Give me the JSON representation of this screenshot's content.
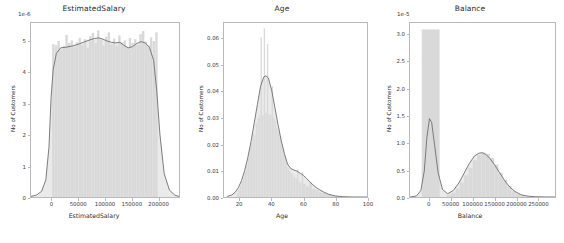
{
  "figure": {
    "background_color": "#ffffff",
    "hist_fill_color": "#d9d9d9",
    "kde_line_color": "#6e6e6e",
    "axis_color": "#b9b9b9",
    "text_color": "#2b2b2b"
  },
  "chart_data": [
    {
      "type": "area",
      "title": "EstimatedSalary",
      "xlabel": "EstimatedSalary",
      "ylabel": "No of Customers",
      "y_exponent_label": "1e-6",
      "grid": false,
      "legend": "none",
      "xlim": [
        -40000,
        240000
      ],
      "ylim": [
        0,
        5.6
      ],
      "xticks": [
        0,
        50000,
        100000,
        150000,
        200000
      ],
      "xticklabels": [
        "0",
        "50000",
        "100000",
        "150000",
        "200000"
      ],
      "yticks": [
        0,
        1,
        2,
        3,
        4,
        5
      ],
      "yticklabels": [
        "0",
        "1",
        "2",
        "3",
        "4",
        "5"
      ],
      "series": [
        {
          "name": "histogram",
          "bin_centers": [
            2500,
            7500,
            12500,
            17500,
            22500,
            27500,
            32500,
            37500,
            42500,
            47500,
            52500,
            57500,
            62500,
            67500,
            72500,
            77500,
            82500,
            87500,
            92500,
            97500,
            102500,
            107500,
            112500,
            117500,
            122500,
            127500,
            132500,
            137500,
            142500,
            147500,
            152500,
            157500,
            162500,
            167500,
            172500,
            177500,
            182500,
            187500,
            192500,
            197500
          ],
          "values": [
            4.92,
            4.88,
            5.02,
            4.74,
            4.86,
            5.22,
            4.96,
            5.04,
            4.84,
            4.98,
            5.12,
            4.9,
            5.08,
            4.8,
            5.18,
            5.28,
            4.94,
            5.36,
            5.06,
            4.88,
            5.16,
            5.3,
            4.92,
            5.1,
            4.86,
            5.2,
            4.98,
            5.04,
            4.82,
            5.12,
            4.96,
            5.08,
            4.9,
            5.24,
            5.34,
            5.0,
            4.88,
            5.14,
            5.02,
            5.3
          ]
        },
        {
          "name": "kde",
          "x": [
            -40000,
            -30000,
            -20000,
            -12000,
            -6000,
            -2000,
            2000,
            8000,
            16000,
            26000,
            38000,
            50000,
            62000,
            72000,
            80000,
            88000,
            96000,
            104000,
            112000,
            120000,
            128000,
            136000,
            144000,
            152000,
            160000,
            168000,
            176000,
            184000,
            192000,
            198000,
            204000,
            212000,
            222000,
            232000,
            240000
          ],
          "y": [
            0.02,
            0.06,
            0.18,
            0.55,
            1.6,
            3.2,
            4.1,
            4.62,
            4.8,
            4.82,
            4.86,
            4.92,
            5.0,
            5.06,
            5.1,
            5.12,
            5.08,
            5.02,
            4.98,
            4.96,
            4.98,
            4.88,
            4.8,
            4.84,
            4.94,
            5.0,
            4.96,
            4.82,
            4.4,
            3.4,
            2.0,
            0.75,
            0.22,
            0.06,
            0.02
          ]
        }
      ]
    },
    {
      "type": "area",
      "title": "Age",
      "xlabel": "Age",
      "ylabel": "No of Customers",
      "y_exponent_label": "",
      "grid": false,
      "legend": "none",
      "xlim": [
        10,
        100
      ],
      "ylim": [
        0,
        0.066
      ],
      "xticks": [
        20,
        40,
        60,
        80,
        100
      ],
      "xticklabels": [
        "20",
        "40",
        "60",
        "80",
        "100"
      ],
      "yticks": [
        0.0,
        0.01,
        0.02,
        0.03,
        0.04,
        0.05,
        0.06
      ],
      "yticklabels": [
        "0.00",
        "0.01",
        "0.02",
        "0.03",
        "0.04",
        "0.05",
        "0.06"
      ],
      "series": [
        {
          "name": "histogram",
          "bin_centers": [
            18.5,
            19.5,
            20.5,
            21.5,
            22.5,
            23.5,
            24.5,
            25.5,
            26.5,
            27.5,
            28.5,
            29.5,
            30.5,
            31.5,
            32.5,
            33.5,
            34.5,
            35.5,
            36.5,
            37.5,
            38.5,
            39.5,
            40.5,
            41.5,
            42.5,
            43.5,
            44.5,
            45.5,
            46.5,
            47.5,
            48.5,
            49.5,
            50.5,
            51.5,
            52.5,
            53.5,
            54.5,
            55.5,
            56.5,
            57.5,
            58.5,
            59.5,
            60.5,
            62.5,
            64.5,
            66.5,
            68.5,
            70.5,
            72.5,
            75.5,
            79.5
          ],
          "values": [
            0.0015,
            0.0028,
            0.0042,
            0.006,
            0.0075,
            0.0095,
            0.012,
            0.015,
            0.0185,
            0.0205,
            0.024,
            0.0235,
            0.028,
            0.03,
            0.031,
            0.0605,
            0.031,
            0.064,
            0.032,
            0.058,
            0.0315,
            0.031,
            0.042,
            0.03,
            0.029,
            0.026,
            0.0245,
            0.023,
            0.02,
            0.018,
            0.0155,
            0.013,
            0.011,
            0.01,
            0.009,
            0.0085,
            0.0075,
            0.007,
            0.0105,
            0.006,
            0.0055,
            0.0095,
            0.005,
            0.004,
            0.0055,
            0.003,
            0.0025,
            0.002,
            0.0015,
            0.001,
            0.0005
          ]
        },
        {
          "name": "kde",
          "x": [
            12,
            15,
            17,
            19,
            21,
            23,
            25,
            27,
            29,
            31,
            33,
            35,
            36.5,
            38,
            40,
            42,
            44,
            46,
            48,
            50,
            52,
            54,
            56,
            58,
            60,
            62,
            64,
            66,
            68,
            70,
            73,
            76,
            80,
            85,
            92,
            100
          ],
          "y": [
            0.0002,
            0.0008,
            0.0018,
            0.0035,
            0.0062,
            0.01,
            0.015,
            0.021,
            0.028,
            0.035,
            0.042,
            0.0455,
            0.046,
            0.045,
            0.0405,
            0.034,
            0.0275,
            0.0215,
            0.0165,
            0.0125,
            0.0108,
            0.0102,
            0.0098,
            0.009,
            0.0082,
            0.007,
            0.0058,
            0.0046,
            0.0036,
            0.0028,
            0.0018,
            0.001,
            0.0004,
            0.0001,
            0.0,
            0.0
          ]
        }
      ]
    },
    {
      "type": "area",
      "title": "Balance",
      "xlabel": "Balance",
      "ylabel": "No of Customers",
      "y_exponent_label": "1e-5",
      "grid": false,
      "legend": "none",
      "xlim": [
        -45000,
        290000
      ],
      "ylim": [
        0,
        3.22
      ],
      "xticks": [
        0,
        50000,
        100000,
        150000,
        200000,
        250000
      ],
      "xticklabels": [
        "0",
        "50000",
        "100000",
        "150000",
        "200000",
        "250000"
      ],
      "yticks": [
        0.0,
        0.5,
        1.0,
        1.5,
        2.0,
        2.5,
        3.0
      ],
      "yticklabels": [
        "0.0",
        "0.5",
        "1.0",
        "1.5",
        "2.0",
        "2.5",
        "3.0"
      ],
      "series": [
        {
          "name": "histogram",
          "bin_centers": [
            3000,
            45000,
            55000,
            65000,
            75000,
            85000,
            95000,
            105000,
            115000,
            125000,
            135000,
            145000,
            155000,
            165000,
            175000,
            185000,
            195000,
            205000,
            215000
          ],
          "values": [
            3.1,
            0.04,
            0.08,
            0.16,
            0.27,
            0.4,
            0.54,
            0.68,
            0.78,
            0.82,
            0.8,
            0.72,
            0.6,
            0.45,
            0.32,
            0.2,
            0.11,
            0.05,
            0.02
          ]
        },
        {
          "name": "kde",
          "x": [
            -45000,
            -30000,
            -20000,
            -12000,
            -6000,
            0,
            5000,
            12000,
            20000,
            30000,
            42000,
            55000,
            68000,
            80000,
            92000,
            104000,
            114000,
            122000,
            130000,
            140000,
            150000,
            162000,
            174000,
            186000,
            198000,
            212000,
            228000,
            245000,
            265000,
            290000
          ],
          "y": [
            0.0,
            0.02,
            0.12,
            0.48,
            1.1,
            1.45,
            1.38,
            0.95,
            0.45,
            0.14,
            0.06,
            0.12,
            0.26,
            0.44,
            0.62,
            0.76,
            0.81,
            0.82,
            0.79,
            0.71,
            0.6,
            0.45,
            0.3,
            0.18,
            0.1,
            0.04,
            0.015,
            0.005,
            0.001,
            0.0
          ]
        }
      ]
    }
  ]
}
